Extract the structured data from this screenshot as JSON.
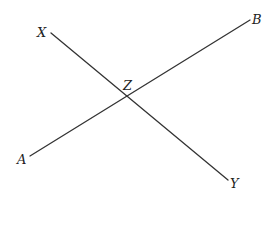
{
  "diagram": {
    "type": "intersecting-lines",
    "colors": {
      "line": "#333333",
      "label": "#222222",
      "background": "#ffffff"
    },
    "points": {
      "X": {
        "label": "X",
        "x": 51,
        "y": 33
      },
      "Y": {
        "label": "Y",
        "x": 228,
        "y": 180
      },
      "A": {
        "label": "A",
        "x": 30,
        "y": 156
      },
      "B": {
        "label": "B",
        "x": 250,
        "y": 20
      },
      "Z": {
        "label": "Z",
        "x": 128,
        "y": 96
      }
    },
    "segments": [
      {
        "name": "XY",
        "from": "X",
        "to": "Y"
      },
      {
        "name": "AB",
        "from": "A",
        "to": "B"
      }
    ],
    "intersection": {
      "point": "Z",
      "of": [
        "AB",
        "XY"
      ]
    }
  }
}
